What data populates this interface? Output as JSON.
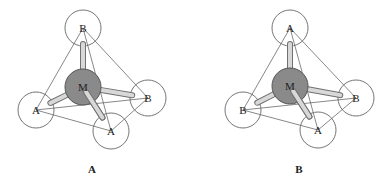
{
  "colors": {
    "line": "#555555",
    "circle_stroke": "#666666",
    "metal_fill": "#8a8a8a",
    "metal_stroke": "#555555",
    "bond_fill": "#d8d8d8",
    "bond_stroke": "#707070",
    "background": "#ffffff"
  },
  "panels": [
    {
      "label": "A",
      "label_pos": [
        92,
        173
      ],
      "metal": {
        "symbol": "M",
        "x": 83,
        "y": 87,
        "r": 18
      },
      "ligands": [
        {
          "symbol": "B",
          "x": 83,
          "y": 28,
          "r": 18,
          "position": "top"
        },
        {
          "symbol": "A",
          "x": 36,
          "y": 110,
          "r": 18,
          "position": "left"
        },
        {
          "symbol": "B",
          "x": 148,
          "y": 98,
          "r": 18,
          "position": "right"
        },
        {
          "symbol": "A",
          "x": 111,
          "y": 131,
          "r": 18,
          "position": "bottom"
        }
      ]
    },
    {
      "label": "B",
      "label_pos": [
        299,
        173
      ],
      "metal": {
        "symbol": "M",
        "x": 290,
        "y": 86,
        "r": 18
      },
      "ligands": [
        {
          "symbol": "A",
          "x": 290,
          "y": 28,
          "r": 18,
          "position": "top"
        },
        {
          "symbol": "B",
          "x": 243,
          "y": 110,
          "r": 18,
          "position": "left"
        },
        {
          "symbol": "B",
          "x": 356,
          "y": 98,
          "r": 18,
          "position": "right"
        },
        {
          "symbol": "A",
          "x": 318,
          "y": 130,
          "r": 18,
          "position": "bottom"
        }
      ]
    }
  ]
}
